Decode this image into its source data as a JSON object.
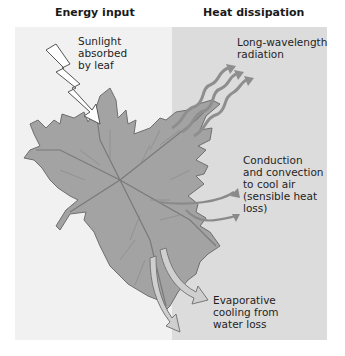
{
  "headings": {
    "left": "Energy input",
    "right": "Heat dissipation"
  },
  "labels": {
    "sunlight": "Sunlight\nabsorbed\nby leaf",
    "radiation": "Long-wavelength\nradiation",
    "conduction": "Conduction\nand convection\nto cool air\n(sensible heat\nloss)",
    "evaporative": "Evaporative\ncooling from\nwater loss"
  },
  "colors": {
    "left_panel": "#f1f1f1",
    "right_panel": "#dcdcdc",
    "leaf": "#9a9a9a",
    "arrow": "#8c8c8c"
  }
}
